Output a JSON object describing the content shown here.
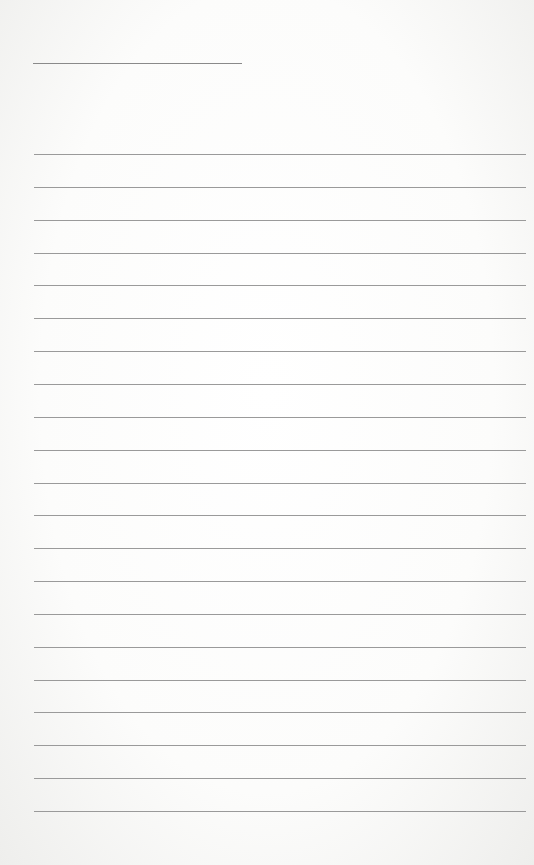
{
  "page": {
    "type": "lined-paper",
    "title_line": {
      "x": 33,
      "y": 63,
      "width": 209,
      "text": ""
    },
    "rules": {
      "count": 21,
      "start_y": 154,
      "spacing": 32.85,
      "x": 34,
      "width": 492
    },
    "line_color": "#9a9a9a",
    "background_color": "#ffffff"
  }
}
